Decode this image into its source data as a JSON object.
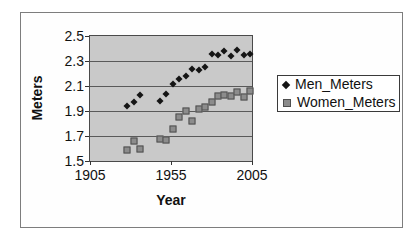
{
  "chart_data": {
    "type": "scatter",
    "title": "",
    "xlabel": "Year",
    "ylabel": "Meters",
    "xlim": [
      1905,
      2005
    ],
    "ylim": [
      1.5,
      2.5
    ],
    "x_ticks": [
      1905,
      1955,
      2005
    ],
    "x_tick_labels": [
      "1905",
      "1955",
      "2005"
    ],
    "y_ticks": [
      1.5,
      1.7,
      1.9,
      2.1,
      2.3,
      2.5
    ],
    "y_tick_labels": [
      "1.5",
      "1.7",
      "1.9",
      "2.1",
      "2.3",
      "2.5"
    ],
    "grid": "horizontal",
    "legend_position": "right",
    "plot_background": "#c9c9c9",
    "x": [
      1928,
      1932,
      1936,
      1948,
      1952,
      1956,
      1960,
      1964,
      1968,
      1972,
      1976,
      1980,
      1984,
      1988,
      1992,
      1996,
      2000,
      2004
    ],
    "series": [
      {
        "name": "Men_Meters",
        "marker": "diamond",
        "color": "#151515",
        "values": [
          1.94,
          1.97,
          2.03,
          1.98,
          2.04,
          2.12,
          2.16,
          2.18,
          2.24,
          2.23,
          2.25,
          2.36,
          2.35,
          2.38,
          2.34,
          2.39,
          2.35,
          2.36
        ]
      },
      {
        "name": "Women_Meters",
        "marker": "square",
        "color": "#8c8c8c",
        "values": [
          1.59,
          1.66,
          1.6,
          1.68,
          1.67,
          1.76,
          1.85,
          1.9,
          1.82,
          1.92,
          1.93,
          1.97,
          2.02,
          2.03,
          2.02,
          2.05,
          2.01,
          2.06
        ]
      }
    ]
  },
  "legend": {
    "items": [
      {
        "label": "Men_Meters",
        "marker": "diamond",
        "color": "#151515"
      },
      {
        "label": "Women_Meters",
        "marker": "square",
        "color": "#8c8c8c"
      }
    ]
  }
}
